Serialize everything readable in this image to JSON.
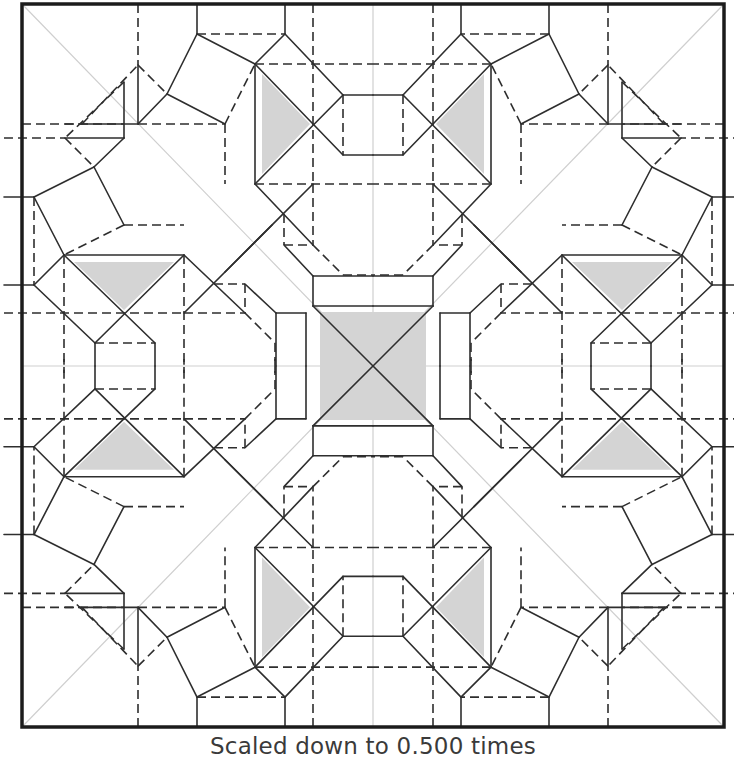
{
  "caption": "Scaled down to 0.500 times",
  "diagram": {
    "type": "origami-crease-pattern",
    "symmetry": "D4 (8-fold mirror about center, horizontal, vertical and diagonals)",
    "colors": {
      "line": "#2e2e2e",
      "border": "#1c1c1c",
      "guide": "#cfcfcf",
      "shade": "#d4d4d4",
      "background": "#ffffff"
    },
    "border": {
      "x1": 22,
      "y1": 4,
      "x2": 724,
      "y2": 727
    },
    "center": {
      "x": 373,
      "y": 366
    },
    "legend": {
      "solid": "mountain fold",
      "dashed": "valley fold",
      "grey_thin": "reference / guide line",
      "grey_fill": "shaded flap region"
    },
    "guides": [
      [
        22,
        4,
        724,
        727
      ],
      [
        724,
        4,
        22,
        727
      ],
      [
        373,
        4,
        373,
        727
      ],
      [
        22,
        366,
        724,
        366
      ]
    ],
    "quadrant_top_left": {
      "solid": [
        [
          138,
          65,
          138,
          124
        ],
        [
          82,
          124,
          138,
          124
        ],
        [
          138,
          124,
          167,
          94
        ],
        [
          167,
          94,
          197,
          34
        ],
        [
          197,
          4,
          197,
          34
        ],
        [
          197,
          34,
          255,
          64
        ],
        [
          167,
          94,
          225,
          124
        ],
        [
          285,
          4,
          285,
          34
        ],
        [
          285,
          34,
          255,
          64
        ],
        [
          285,
          34,
          343,
          95
        ],
        [
          255,
          64,
          255,
          184
        ],
        [
          255,
          64,
          343,
          155
        ],
        [
          255,
          184,
          343,
          95
        ],
        [
          343,
          95,
          373,
          95
        ],
        [
          343,
          155,
          373,
          155
        ],
        [
          255,
          184,
          313,
          245
        ],
        [
          313,
          184,
          225,
          272
        ],
        [
          313,
          276,
          373,
          276
        ],
        [
          284,
          245,
          313,
          276
        ],
        [
          313,
          276,
          313,
          306
        ],
        [
          313,
          306,
          373,
          306
        ],
        [
          313,
          306,
          373,
          366
        ],
        [
          65,
          138,
          124,
          138
        ],
        [
          124,
          82,
          124,
          138
        ],
        [
          124,
          138,
          94,
          167
        ],
        [
          94,
          167,
          34,
          197
        ],
        [
          4,
          197,
          34,
          197
        ],
        [
          34,
          197,
          64,
          255
        ],
        [
          94,
          167,
          124,
          225
        ],
        [
          4,
          285,
          34,
          285
        ],
        [
          34,
          285,
          64,
          255
        ],
        [
          34,
          285,
          95,
          343
        ],
        [
          64,
          255,
          184,
          255
        ],
        [
          64,
          255,
          155,
          343
        ],
        [
          184,
          255,
          95,
          343
        ],
        [
          95,
          343,
          95,
          366
        ],
        [
          155,
          343,
          155,
          366
        ],
        [
          184,
          255,
          245,
          313
        ],
        [
          184,
          313,
          272,
          225
        ],
        [
          276,
          313,
          276,
          366
        ],
        [
          245,
          284,
          276,
          313
        ],
        [
          276,
          313,
          306,
          313
        ],
        [
          306,
          313,
          306,
          366
        ]
      ],
      "dashed": [
        [
          138,
          4,
          138,
          65
        ],
        [
          22,
          124,
          82,
          124
        ],
        [
          138,
          124,
          225,
          124
        ],
        [
          82,
          124,
          138,
          65
        ],
        [
          138,
          65,
          167,
          94
        ],
        [
          197,
          34,
          285,
          34
        ],
        [
          225,
          124,
          255,
          64
        ],
        [
          313,
          4,
          313,
          185
        ],
        [
          255,
          64,
          373,
          64
        ],
        [
          343,
          95,
          343,
          155
        ],
        [
          255,
          184,
          373,
          184
        ],
        [
          313,
          184,
          313,
          245
        ],
        [
          313,
          245,
          343,
          275
        ],
        [
          343,
          275,
          373,
          275
        ],
        [
          284,
          214,
          284,
          245
        ],
        [
          284,
          245,
          313,
          245
        ],
        [
          225,
          124,
          225,
          184
        ],
        [
          124,
          225,
          184,
          225
        ],
        [
          65,
          124,
          124,
          124
        ],
        [
          4,
          138,
          65,
          138
        ],
        [
          124,
          82,
          65,
          138
        ],
        [
          65,
          138,
          94,
          167
        ],
        [
          34,
          197,
          34,
          285
        ],
        [
          124,
          225,
          64,
          255
        ],
        [
          4,
          313,
          185,
          313
        ],
        [
          64,
          255,
          64,
          373
        ],
        [
          95,
          343,
          155,
          343
        ],
        [
          184,
          255,
          184,
          373
        ],
        [
          184,
          313,
          245,
          313
        ],
        [
          245,
          313,
          275,
          343
        ],
        [
          275,
          343,
          275,
          373
        ],
        [
          214,
          284,
          245,
          284
        ],
        [
          245,
          284,
          245,
          313
        ]
      ],
      "shades": [
        [
          [
            262,
            74
          ],
          [
            262,
            174
          ],
          [
            310,
            124
          ]
        ],
        [
          [
            74,
            262
          ],
          [
            174,
            262
          ],
          [
            124,
            310
          ]
        ]
      ],
      "center_shade": {
        "x": 320,
        "y": 312,
        "w": 106,
        "h": 108
      }
    }
  }
}
